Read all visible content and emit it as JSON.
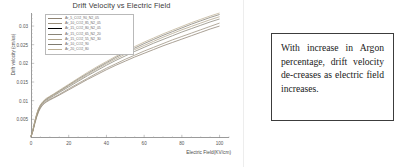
{
  "chart_data": {
    "type": "line",
    "title": "Drift Velocity vs Electric Field",
    "xlabel": "Electric Field(KV/cm)",
    "ylabel": "Drift velocity (cm/us)",
    "xlim": [
      0,
      105
    ],
    "ylim": [
      0,
      0.0335
    ],
    "grid": false,
    "legend_position": "top-left",
    "xticks": [
      0,
      20,
      40,
      60,
      80,
      100
    ],
    "xticklabels": [
      "0",
      "20",
      "40",
      "60",
      "80",
      "100"
    ],
    "yticks": [
      0.005,
      0.01,
      0.015,
      0.02,
      0.025,
      0.03
    ],
    "yticklabels": [
      "0.005",
      "0.01",
      "0.015",
      "0.02",
      "0.025",
      "0.03"
    ],
    "x": [
      0,
      1,
      2,
      3,
      4,
      5,
      6,
      7,
      8,
      10,
      12,
      15,
      20,
      25,
      30,
      35,
      40,
      45,
      50,
      55,
      60,
      65,
      70,
      75,
      80,
      85,
      90,
      95,
      100
    ],
    "series": [
      {
        "name": "Ar_5_CO2_90_N2_05",
        "color": "#8d8272",
        "values": [
          0.0004,
          0.0018,
          0.0038,
          0.0056,
          0.007,
          0.008,
          0.0087,
          0.0092,
          0.0096,
          0.0102,
          0.0107,
          0.0115,
          0.0129,
          0.0143,
          0.0157,
          0.017,
          0.0183,
          0.0195,
          0.0206,
          0.0217,
          0.0227,
          0.0237,
          0.0247,
          0.0256,
          0.0265,
          0.0274,
          0.0283,
          0.0292,
          0.03
        ]
      },
      {
        "name": "Ar_10_CO2_85_N2_05",
        "color": "#9a8f7c",
        "values": [
          0.0004,
          0.0019,
          0.004,
          0.0058,
          0.0072,
          0.0082,
          0.0089,
          0.0094,
          0.0098,
          0.0104,
          0.0109,
          0.0117,
          0.0132,
          0.0146,
          0.016,
          0.0174,
          0.0187,
          0.0199,
          0.0211,
          0.0222,
          0.0233,
          0.0243,
          0.0253,
          0.0263,
          0.0272,
          0.0281,
          0.029,
          0.0299,
          0.0308
        ]
      },
      {
        "name": "Ar_15_CO2_80_N2_05",
        "color": "#a39madd",
        "values": [
          0.0004,
          0.002,
          0.0041,
          0.006,
          0.0074,
          0.0084,
          0.0091,
          0.0096,
          0.01,
          0.0106,
          0.0111,
          0.012,
          0.0135,
          0.0149,
          0.0164,
          0.0178,
          0.0191,
          0.0204,
          0.0216,
          0.0227,
          0.0238,
          0.0249,
          0.0259,
          0.0269,
          0.0279,
          0.0288,
          0.0297,
          0.0306,
          0.0314
        ]
      },
      {
        "name": "Ar_15_CO2_65_N2_20",
        "color": "#8a8578",
        "values": [
          0.0004,
          0.002,
          0.0042,
          0.0061,
          0.0075,
          0.0085,
          0.0092,
          0.0097,
          0.0101,
          0.0107,
          0.0113,
          0.0122,
          0.0137,
          0.0152,
          0.0167,
          0.0181,
          0.0195,
          0.0208,
          0.022,
          0.0232,
          0.0243,
          0.0254,
          0.0264,
          0.0274,
          0.0284,
          0.0293,
          0.0302,
          0.0311,
          0.0319
        ]
      },
      {
        "name": "Ar_15_CO2_55_N2_30",
        "color": "#b0a48b",
        "values": [
          0.0004,
          0.0021,
          0.0043,
          0.0062,
          0.0077,
          0.0087,
          0.0094,
          0.0099,
          0.0103,
          0.0109,
          0.0115,
          0.0124,
          0.014,
          0.0155,
          0.017,
          0.0185,
          0.0199,
          0.0212,
          0.0225,
          0.0237,
          0.0248,
          0.0259,
          0.027,
          0.028,
          0.029,
          0.0299,
          0.0308,
          0.0317,
          0.0325
        ]
      },
      {
        "name": "Ar_10_CO2_90",
        "color": "#7f7b70",
        "values": [
          0.0004,
          0.0021,
          0.0044,
          0.0063,
          0.0078,
          0.0088,
          0.0095,
          0.01,
          0.0104,
          0.0111,
          0.0117,
          0.0126,
          0.0142,
          0.0158,
          0.0173,
          0.0188,
          0.0202,
          0.0216,
          0.0229,
          0.0241,
          0.0253,
          0.0264,
          0.0275,
          0.0285,
          0.0295,
          0.0305,
          0.0314,
          0.0323,
          0.0331
        ]
      },
      {
        "name": "Ar_20_CO2_80",
        "color": "#bdb094",
        "values": [
          0.0004,
          0.0021,
          0.0045,
          0.0064,
          0.0079,
          0.0089,
          0.0096,
          0.0101,
          0.0106,
          0.0112,
          0.0118,
          0.0128,
          0.0144,
          0.016,
          0.0176,
          0.0191,
          0.0205,
          0.0219,
          0.0232,
          0.0245,
          0.0257,
          0.0268,
          0.0279,
          0.0289,
          0.0299,
          0.0309,
          0.0318,
          0.0327,
          0.0335
        ]
      }
    ]
  },
  "note": {
    "text": "With increase in Argon percentage, drift velocity de‐creases as electric field increases."
  }
}
